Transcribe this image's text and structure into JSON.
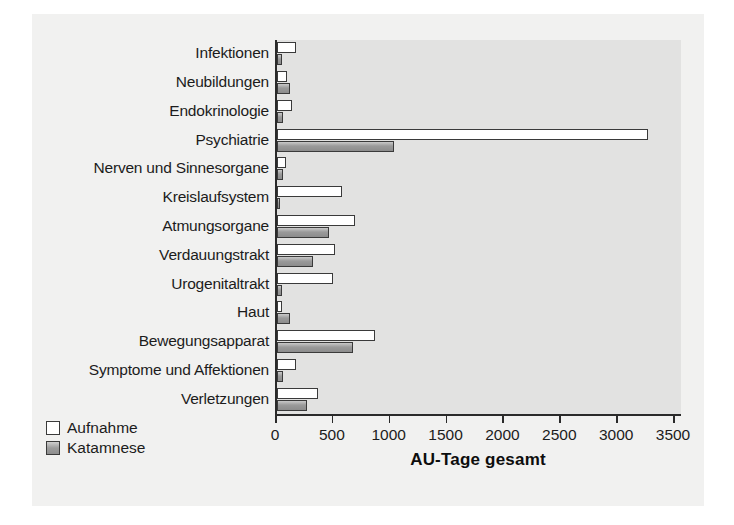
{
  "chart_data": {
    "type": "bar",
    "orientation": "horizontal",
    "title": "",
    "xlabel": "AU-Tage gesamt",
    "ylabel": "",
    "xlim": [
      0,
      3500
    ],
    "xticks": [
      0,
      500,
      1000,
      1500,
      2000,
      2500,
      3000,
      3500
    ],
    "xtick_labels": [
      "0",
      "500",
      "1000",
      "1500",
      "2000",
      "2500",
      "3000",
      "3500"
    ],
    "grid": false,
    "legend_position": "bottom-left",
    "categories": [
      "Infektionen",
      "Neubildungen",
      "Endokrinologie",
      "Psychiatrie",
      "Nerven und Sinnesorgane",
      "Kreislaufsystem",
      "Atmungsorgane",
      "Verdauungstrakt",
      "Urogenitaltrakt",
      "Haut",
      "Bewegungsapparat",
      "Symptome und Affektionen",
      "Verletzungen"
    ],
    "series": [
      {
        "name": "Aufnahme",
        "color": "#ffffff",
        "values": [
          170,
          85,
          130,
          3260,
          75,
          570,
          690,
          510,
          490,
          45,
          860,
          170,
          360
        ]
      },
      {
        "name": "Katamnese",
        "color": "#9a9a9a",
        "values": [
          45,
          115,
          50,
          1030,
          50,
          30,
          455,
          320,
          45,
          110,
          665,
          55,
          265
        ]
      }
    ]
  },
  "legend": {
    "items": [
      {
        "label": "Aufnahme",
        "swatch": "aufnahme"
      },
      {
        "label": "Katamnese",
        "swatch": "katamnese"
      }
    ]
  }
}
